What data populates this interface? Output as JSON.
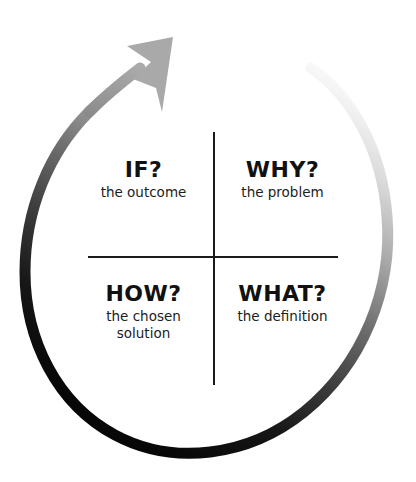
{
  "canvas": {
    "width": 416,
    "height": 482,
    "background": "#ffffff"
  },
  "diagram": {
    "title_visible": false,
    "type": "four-quadrant-cycle",
    "loop": {
      "name": "counterclockwise-cycle-arrow",
      "direction": "counterclockwise",
      "arrowhead_position": "top",
      "arrowhead_points": "up-right",
      "gradient_description": "fades from near-white at top-right to black at bottom-left, light gray at arrowhead",
      "color_start": "#fbfbfb",
      "color_mid": "#6e6e6e",
      "color_end": "#0a0a0a",
      "arrowhead_color": "#a8a8a8",
      "stroke_width": 11
    },
    "cross": {
      "vertical_color": "#1a1a1a",
      "horizontal_color": "#1a1a1a"
    },
    "quadrants": [
      {
        "id": "if",
        "position": "top-left",
        "question": "IF?",
        "caption": "the outcome"
      },
      {
        "id": "why",
        "position": "top-right",
        "question": "WHY?",
        "caption": "the problem"
      },
      {
        "id": "how",
        "position": "bottom-left",
        "question": "HOW?",
        "caption": "the chosen\nsolution"
      },
      {
        "id": "what",
        "position": "bottom-right",
        "question": "WHAT?",
        "caption": "the definition"
      }
    ]
  }
}
